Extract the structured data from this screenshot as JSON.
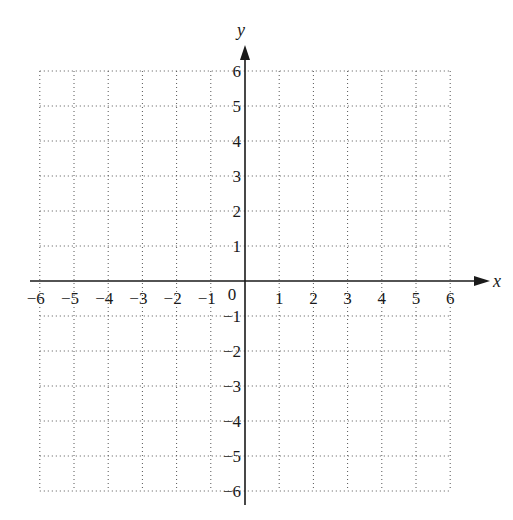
{
  "chart_data": {
    "type": "scatter",
    "title": "",
    "xlabel": "x",
    "ylabel": "y",
    "xlim": [
      -6,
      6
    ],
    "ylim": [
      -6,
      6
    ],
    "grid": true,
    "grid_style": "dotted",
    "x_ticks": [
      -6,
      -5,
      -4,
      -3,
      -2,
      -1,
      1,
      2,
      3,
      4,
      5,
      6
    ],
    "y_ticks": [
      -6,
      -5,
      -4,
      -3,
      -2,
      -1,
      1,
      2,
      3,
      4,
      5,
      6
    ],
    "x_tick_labels": [
      "−6",
      "−5",
      "−4",
      "−3",
      "−2",
      "−1",
      "1",
      "2",
      "3",
      "4",
      "5",
      "6"
    ],
    "y_tick_labels": [
      "−6",
      "−5",
      "−4",
      "−3",
      "−2",
      "−1",
      "1",
      "2",
      "3",
      "4",
      "5",
      "6"
    ],
    "origin_label": "0",
    "series": [],
    "legend": null
  },
  "axes": {
    "x_label": "x",
    "y_label": "y",
    "origin": "0"
  },
  "colors": {
    "axis": "#1a1a1a",
    "grid": "#555555",
    "background": "#ffffff"
  }
}
